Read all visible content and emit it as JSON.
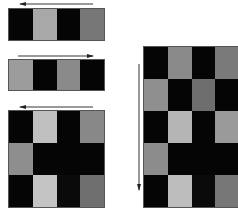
{
  "panels": [
    {
      "id": "strip-1",
      "rows": 1,
      "cols": 4,
      "x": 8,
      "y": 8,
      "w": 97,
      "h": 33,
      "cells": [
        "#050505",
        "#a8a8a8",
        "#050505",
        "#777777"
      ],
      "arrow": {
        "direction": "left",
        "x1": 20,
        "x2": 93,
        "y": 4
      }
    },
    {
      "id": "strip-2",
      "rows": 1,
      "cols": 4,
      "x": 8,
      "y": 59,
      "w": 97,
      "h": 32,
      "cells": [
        "#9c9c9c",
        "#050505",
        "#8a8a8a",
        "#050505"
      ],
      "arrow": {
        "direction": "right",
        "x1": 18,
        "x2": 93,
        "y": 56
      }
    },
    {
      "id": "grid-3x4",
      "rows": 3,
      "cols": 4,
      "x": 8,
      "y": 110,
      "w": 97,
      "h": 98,
      "cells": [
        "#050505",
        "#c0c0c0",
        "#050505",
        "#888888",
        "#8e8e8e",
        "#050505",
        "#050505",
        "#050505",
        "#050505",
        "#c4c4c4",
        "#0a0a0a",
        "#6f6f6f"
      ],
      "arrow": {
        "direction": "left",
        "x1": 20,
        "x2": 93,
        "y": 107
      }
    },
    {
      "id": "grid-5x4",
      "rows": 5,
      "cols": 4,
      "x": 143,
      "y": 46,
      "w": 97,
      "h": 162,
      "cells": [
        "#050505",
        "#8a8a8a",
        "#050505",
        "#7a7a7a",
        "#8f8f8f",
        "#050505",
        "#6e6e6e",
        "#050505",
        "#050505",
        "#b5b5b5",
        "#050505",
        "#9a9a9a",
        "#8c8c8c",
        "#050505",
        "#050505",
        "#050505",
        "#050505",
        "#bdbdbd",
        "#0a0a0a",
        "#777777"
      ],
      "arrow": {
        "direction": "down",
        "x": 139,
        "y1": 64,
        "y2": 190
      }
    }
  ]
}
